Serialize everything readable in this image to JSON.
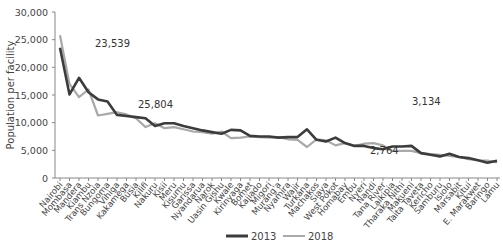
{
  "chart_data": {
    "type": "line",
    "title": "",
    "xlabel": "",
    "ylabel": "Population per facility",
    "ylim": [
      0,
      30000
    ],
    "yticks": [
      0,
      5000,
      10000,
      15000,
      20000,
      25000,
      30000
    ],
    "ytick_labels": [
      "0",
      "5,000",
      "10,000",
      "15,000",
      "20,000",
      "25,000",
      "30,000"
    ],
    "grid": false,
    "legend_position": "bottom",
    "categories": [
      "Nairobi",
      "Mombasa",
      "Mandera",
      "Kiambu",
      "Trans Nzoia",
      "Bungoma",
      "Vihiga",
      "Kakamega",
      "Busia",
      "Kilifi",
      "Nakuru",
      "Kisii",
      "Meru",
      "Kisumu",
      "Garissa",
      "Nyandarua",
      "Narok",
      "Uasin Gishu",
      "Kwale",
      "Kirinyaga",
      "Bomet",
      "Kajiado",
      "Migori",
      "Murang'a",
      "Nyamira",
      "Wajir",
      "Turkana",
      "Machakos",
      "Siaya",
      "West Pokot",
      "Homabay",
      "Embu",
      "Nyeri",
      "Nandi",
      "Tana River",
      "Laikipia",
      "Tharaka Nithi",
      "Makueni",
      "Taita Taveta",
      "Kericho",
      "Samburu",
      "Isiolo",
      "Marsabit",
      "Kitui",
      "E. Marakwet",
      "Baringo",
      "Lamu"
    ],
    "series": [
      {
        "name": "2013",
        "color": "#3c3c3c",
        "values": [
          23539,
          15100,
          18100,
          15500,
          14200,
          13800,
          11400,
          11200,
          11000,
          10800,
          9400,
          9900,
          9900,
          9400,
          9000,
          8600,
          8300,
          8000,
          8700,
          8600,
          7600,
          7500,
          7500,
          7300,
          7400,
          7400,
          8800,
          6900,
          6600,
          7300,
          6300,
          5800,
          5800,
          5400,
          5200,
          5700,
          5700,
          5800,
          4500,
          4200,
          3900,
          4400,
          3800,
          3600,
          3200,
          2764,
          3100
        ]
      },
      {
        "name": "2018",
        "color": "#a9a9a9",
        "values": [
          25804,
          17000,
          14600,
          16000,
          11300,
          11600,
          11900,
          11500,
          10800,
          9200,
          9900,
          9000,
          9200,
          8800,
          8400,
          8300,
          8000,
          8400,
          7200,
          7300,
          7500,
          7400,
          7300,
          7400,
          7000,
          6900,
          5600,
          7000,
          6800,
          5900,
          6300,
          5800,
          6200,
          6300,
          5900,
          4900,
          4900,
          4900,
          4500,
          4300,
          4200,
          4000,
          3800,
          3400,
          3200,
          3134,
          2800
        ]
      }
    ],
    "annotations": [
      {
        "text": "23,539",
        "x": 95,
        "y": 47
      },
      {
        "text": "25,804",
        "x": 138,
        "y": 108
      },
      {
        "text": "2,764",
        "x": 370,
        "y": 154
      },
      {
        "text": "3,134",
        "x": 412,
        "y": 105
      }
    ]
  }
}
